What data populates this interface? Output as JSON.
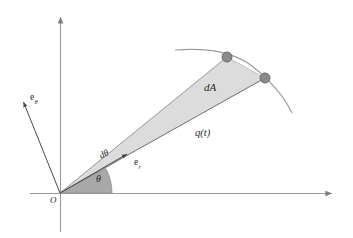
{
  "figure": {
    "background_color": "#ffffff",
    "axis_color": "#8c8c8c",
    "ray_color": "#6e6e6e",
    "wedge_fill": "#dcdcdc",
    "wedge_stroke": "#b4b4b4",
    "sector_fill": "#a8a8a8",
    "sector_stroke": "#8f8f8f",
    "dot_fill": "#8a8a8a",
    "dot_stroke": "#6a6a6a",
    "curve_color": "#909090",
    "text_color": "#2a2a2a"
  },
  "labels": {
    "origin": "O",
    "theta": "θ",
    "d_theta": "dθ",
    "e_r_base": "e",
    "e_r_sub": "r",
    "e_theta_base": "e",
    "e_theta_sub": "θ",
    "dA": "dA",
    "q_of_t": "q(t)"
  },
  "geometry": {
    "origin": {
      "x": 60,
      "y": 193
    },
    "x_axis": {
      "x1": 30,
      "y1": 193,
      "x2": 338,
      "y2": 193,
      "arrow": "right"
    },
    "y_axis": {
      "x1": 60,
      "y1": 232,
      "x2": 60,
      "y2": 12,
      "arrow": "up"
    },
    "theta_degrees": 28,
    "d_theta_degrees": 5,
    "wedge_vertices": [
      {
        "x": 60,
        "y": 193
      },
      {
        "x": 227,
        "y": 57
      },
      {
        "x": 265,
        "y": 78
      }
    ],
    "particle_1": {
      "x": 227,
      "y": 57,
      "r": 5
    },
    "particle_2": {
      "x": 265,
      "y": 78,
      "r": 5
    },
    "trajectory_arc": {
      "start_x": 175,
      "start_y": 50,
      "end_x": 292,
      "end_y": 113
    },
    "e_r_arrow": {
      "x1": 60,
      "y1": 193,
      "x2": 129,
      "y2": 153
    },
    "e_theta_arrow": {
      "x1": 60,
      "y1": 193,
      "x2": 22,
      "y2": 99
    }
  }
}
